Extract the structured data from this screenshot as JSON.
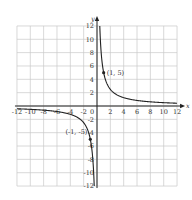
{
  "chart_data": {
    "type": "line",
    "title": "",
    "xlabel": "x",
    "ylabel": "y",
    "xlim": [
      -12,
      12
    ],
    "ylim": [
      -12,
      12
    ],
    "grid": true,
    "grid_step": 2,
    "x_ticks": [
      -12,
      -10,
      -8,
      -6,
      -4,
      -2,
      0,
      2,
      4,
      6,
      8,
      10,
      12
    ],
    "y_ticks": [
      -12,
      -10,
      -8,
      -6,
      -4,
      -2,
      2,
      4,
      6,
      8,
      10,
      12
    ],
    "x_tick_labels": [
      "-12",
      "-10",
      "-8",
      "-6",
      "-4",
      "-2",
      "0",
      "2",
      "4",
      "6",
      "8",
      "10",
      "12"
    ],
    "y_tick_labels": [
      "-12",
      "-10",
      "-8",
      "-6",
      "-4",
      "-2",
      "2",
      "4",
      "6",
      "8",
      "10",
      "12"
    ],
    "series": [
      {
        "name": "y = 5/x",
        "function": "5/x",
        "branches": [
          {
            "x": [
              0.417,
              0.5,
              0.75,
              1,
              1.5,
              2,
              3,
              4,
              6,
              8,
              10,
              12
            ],
            "y": [
              12,
              10,
              6.67,
              5,
              3.33,
              2.5,
              1.67,
              1.25,
              0.83,
              0.63,
              0.5,
              0.42
            ]
          },
          {
            "x": [
              -12,
              -10,
              -8,
              -6,
              -4,
              -3,
              -2,
              -1.5,
              -1,
              -0.75,
              -0.5,
              -0.417
            ],
            "y": [
              -0.42,
              -0.5,
              -0.63,
              -0.83,
              -1.25,
              -1.67,
              -2.5,
              -3.33,
              -5,
              -6.67,
              -10,
              -12
            ]
          }
        ]
      }
    ],
    "points": [
      {
        "x": 1,
        "y": 5,
        "label": "(1, 5)"
      },
      {
        "x": -1,
        "y": -5,
        "label": "(-1, -5)"
      }
    ],
    "axis_labels": {
      "x": "x",
      "y": "y"
    },
    "origin_label": "0"
  }
}
